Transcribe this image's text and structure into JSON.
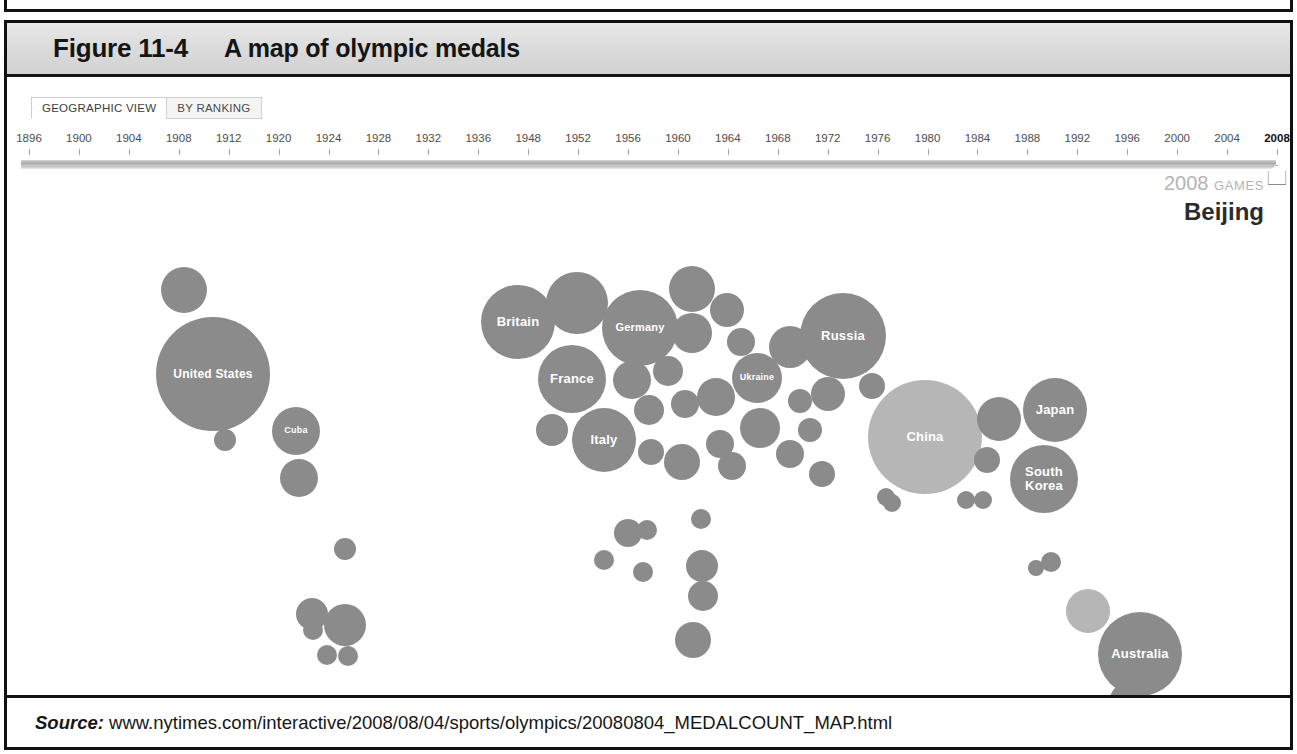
{
  "figure": {
    "number": "Figure 11-4",
    "title": "A map of olympic medals"
  },
  "source": {
    "label": "Source:",
    "url": "www.nytimes.com/interactive/2008/08/04/sports/olympics/20080804_MEDALCOUNT_MAP.html"
  },
  "tabs": [
    {
      "label": "GEOGRAPHIC VIEW",
      "active": true
    },
    {
      "label": "BY RANKING",
      "active": false
    }
  ],
  "timeline": {
    "years": [
      "1896",
      "1900",
      "1904",
      "1908",
      "1912",
      "1920",
      "1924",
      "1928",
      "1932",
      "1936",
      "1948",
      "1952",
      "1956",
      "1960",
      "1964",
      "1968",
      "1972",
      "1976",
      "1980",
      "1984",
      "1988",
      "1992",
      "1996",
      "2000",
      "2004",
      "2008"
    ],
    "selected": "2008",
    "handle_icon": "slider-handle-pentagon"
  },
  "games_caption": {
    "year": "2008",
    "word": "GAMES",
    "city": "Beijing"
  },
  "colors": {
    "bubble_default": "#8b8b8b",
    "bubble_highlight": "#b6b6b6",
    "header_gray": "#dcdcdc",
    "frame_black": "#111111",
    "label_white": "#ffffff"
  },
  "chart_data": {
    "type": "bubble",
    "title": "A map of olympic medals",
    "subtitle": "2008 GAMES Beijing",
    "xlabel": "",
    "ylabel": "",
    "value_encoding": "bubble area = total medals won",
    "legend": "none",
    "grid": false,
    "bubbles": [
      {
        "name": "United States",
        "label": "United States",
        "x": 213,
        "y": 374,
        "r": 57,
        "shade": "default",
        "font": 12
      },
      {
        "name": "Canada",
        "label": "",
        "x": 184,
        "y": 290,
        "r": 23,
        "shade": "default",
        "font": 0
      },
      {
        "name": "Mexico",
        "label": "",
        "x": 225,
        "y": 440,
        "r": 11,
        "shade": "default",
        "font": 0
      },
      {
        "name": "Cuba",
        "label": "Cuba",
        "x": 296,
        "y": 431,
        "r": 24,
        "shade": "default",
        "font": 9
      },
      {
        "name": "Jamaica",
        "label": "",
        "x": 299,
        "y": 478,
        "r": 19,
        "shade": "default",
        "font": 0
      },
      {
        "name": "Colombia",
        "label": "",
        "x": 345,
        "y": 549,
        "r": 11,
        "shade": "default",
        "font": 0
      },
      {
        "name": "Ecuador",
        "label": "",
        "x": 312,
        "y": 614,
        "r": 16,
        "shade": "default",
        "font": 0
      },
      {
        "name": "Peru",
        "label": "",
        "x": 313,
        "y": 630,
        "r": 10,
        "shade": "default",
        "font": 0
      },
      {
        "name": "Brazil",
        "label": "",
        "x": 345,
        "y": 625,
        "r": 21,
        "shade": "default",
        "font": 0
      },
      {
        "name": "Chile",
        "label": "",
        "x": 327,
        "y": 655,
        "r": 10,
        "shade": "default",
        "font": 0
      },
      {
        "name": "Argentina",
        "label": "",
        "x": 348,
        "y": 656,
        "r": 10,
        "shade": "default",
        "font": 0
      },
      {
        "name": "Britain",
        "label": "Britain",
        "x": 518,
        "y": 322,
        "r": 37,
        "shade": "default",
        "font": 13
      },
      {
        "name": "Netherlands",
        "label": "",
        "x": 577,
        "y": 303,
        "r": 31,
        "shade": "default",
        "font": 0
      },
      {
        "name": "Germany",
        "label": "Germany",
        "x": 640,
        "y": 328,
        "r": 38,
        "shade": "default",
        "font": 11
      },
      {
        "name": "Denmark",
        "label": "",
        "x": 692,
        "y": 289,
        "r": 23,
        "shade": "default",
        "font": 0
      },
      {
        "name": "Norway",
        "label": "",
        "x": 692,
        "y": 333,
        "r": 20,
        "shade": "default",
        "font": 0
      },
      {
        "name": "Sweden",
        "label": "",
        "x": 727,
        "y": 310,
        "r": 17,
        "shade": "default",
        "font": 0
      },
      {
        "name": "Poland",
        "label": "",
        "x": 741,
        "y": 342,
        "r": 14,
        "shade": "default",
        "font": 0
      },
      {
        "name": "France",
        "label": "France",
        "x": 572,
        "y": 379,
        "r": 34,
        "shade": "default",
        "font": 13
      },
      {
        "name": "Belgium",
        "label": "",
        "x": 632,
        "y": 380,
        "r": 19,
        "shade": "default",
        "font": 0
      },
      {
        "name": "Czech",
        "label": "",
        "x": 668,
        "y": 371,
        "r": 15,
        "shade": "default",
        "font": 0
      },
      {
        "name": "Austria",
        "label": "",
        "x": 649,
        "y": 410,
        "r": 15,
        "shade": "default",
        "font": 0
      },
      {
        "name": "Hungary",
        "label": "",
        "x": 685,
        "y": 404,
        "r": 14,
        "shade": "default",
        "font": 0
      },
      {
        "name": "Romania",
        "label": "",
        "x": 716,
        "y": 397,
        "r": 19,
        "shade": "default",
        "font": 0
      },
      {
        "name": "Ukraine",
        "label": "Ukraine",
        "x": 757,
        "y": 378,
        "r": 25,
        "shade": "default",
        "font": 9
      },
      {
        "name": "Belarus",
        "label": "",
        "x": 790,
        "y": 347,
        "r": 21,
        "shade": "default",
        "font": 0
      },
      {
        "name": "Italy",
        "label": "Italy",
        "x": 604,
        "y": 440,
        "r": 32,
        "shade": "default",
        "font": 13
      },
      {
        "name": "Spain",
        "label": "",
        "x": 552,
        "y": 430,
        "r": 16,
        "shade": "default",
        "font": 0
      },
      {
        "name": "Slovakia",
        "label": "",
        "x": 651,
        "y": 452,
        "r": 13,
        "shade": "default",
        "font": 0
      },
      {
        "name": "Croatia",
        "label": "",
        "x": 682,
        "y": 462,
        "r": 18,
        "shade": "default",
        "font": 0
      },
      {
        "name": "Slovenia",
        "label": "",
        "x": 720,
        "y": 444,
        "r": 14,
        "shade": "default",
        "font": 0
      },
      {
        "name": "Serbia",
        "label": "",
        "x": 732,
        "y": 466,
        "r": 14,
        "shade": "default",
        "font": 0
      },
      {
        "name": "Bulgaria",
        "label": "",
        "x": 760,
        "y": 428,
        "r": 20,
        "shade": "default",
        "font": 0
      },
      {
        "name": "Greece",
        "label": "",
        "x": 790,
        "y": 454,
        "r": 14,
        "shade": "default",
        "font": 0
      },
      {
        "name": "Turkey",
        "label": "",
        "x": 810,
        "y": 430,
        "r": 12,
        "shade": "default",
        "font": 0
      },
      {
        "name": "Georgia",
        "label": "",
        "x": 828,
        "y": 394,
        "r": 17,
        "shade": "default",
        "font": 0
      },
      {
        "name": "Azerbaijan",
        "label": "",
        "x": 800,
        "y": 401,
        "r": 12,
        "shade": "default",
        "font": 0
      },
      {
        "name": "Russia",
        "label": "Russia",
        "x": 843,
        "y": 336,
        "r": 43,
        "shade": "default",
        "font": 13
      },
      {
        "name": "Kazakhstan",
        "label": "",
        "x": 872,
        "y": 386,
        "r": 13,
        "shade": "default",
        "font": 0
      },
      {
        "name": "Uzbekistan",
        "label": "",
        "x": 822,
        "y": 474,
        "r": 13,
        "shade": "default",
        "font": 0
      },
      {
        "name": "China",
        "label": "China",
        "x": 925,
        "y": 437,
        "r": 57,
        "shade": "highlight",
        "font": 13
      },
      {
        "name": "Mongolia",
        "label": "",
        "x": 886,
        "y": 497,
        "r": 9,
        "shade": "default",
        "font": 0
      },
      {
        "name": "India",
        "label": "",
        "x": 892,
        "y": 503,
        "r": 9,
        "shade": "default",
        "font": 0
      },
      {
        "name": "Thailand",
        "label": "",
        "x": 966,
        "y": 500,
        "r": 9,
        "shade": "default",
        "font": 0
      },
      {
        "name": "Indonesia",
        "label": "",
        "x": 983,
        "y": 500,
        "r": 9,
        "shade": "default",
        "font": 0
      },
      {
        "name": "Taiwan",
        "label": "",
        "x": 999,
        "y": 419,
        "r": 22,
        "shade": "default",
        "font": 0
      },
      {
        "name": "Hong Kong",
        "label": "",
        "x": 987,
        "y": 460,
        "r": 13,
        "shade": "default",
        "font": 0
      },
      {
        "name": "Japan",
        "label": "Japan",
        "x": 1055,
        "y": 410,
        "r": 32,
        "shade": "default",
        "font": 13
      },
      {
        "name": "South Korea",
        "label": "South Korea",
        "x": 1044,
        "y": 479,
        "r": 34,
        "shade": "default",
        "font": 13
      },
      {
        "name": "Ethiopia",
        "label": "",
        "x": 628,
        "y": 533,
        "r": 14,
        "shade": "default",
        "font": 0
      },
      {
        "name": "Kenya",
        "label": "",
        "x": 647,
        "y": 530,
        "r": 10,
        "shade": "default",
        "font": 0
      },
      {
        "name": "Nigeria",
        "label": "",
        "x": 604,
        "y": 560,
        "r": 10,
        "shade": "default",
        "font": 0
      },
      {
        "name": "Cameroon",
        "label": "",
        "x": 643,
        "y": 572,
        "r": 10,
        "shade": "default",
        "font": 0
      },
      {
        "name": "Morocco",
        "label": "",
        "x": 701,
        "y": 519,
        "r": 10,
        "shade": "default",
        "font": 0
      },
      {
        "name": "Egypt",
        "label": "",
        "x": 702,
        "y": 566,
        "r": 16,
        "shade": "default",
        "font": 0
      },
      {
        "name": "Tunisia",
        "label": "",
        "x": 703,
        "y": 596,
        "r": 15,
        "shade": "default",
        "font": 0
      },
      {
        "name": "South Africa",
        "label": "",
        "x": 693,
        "y": 640,
        "r": 18,
        "shade": "default",
        "font": 0
      },
      {
        "name": "Papua",
        "label": "",
        "x": 1036,
        "y": 568,
        "r": 8,
        "shade": "default",
        "font": 0
      },
      {
        "name": "Fiji",
        "label": "",
        "x": 1051,
        "y": 562,
        "r": 10,
        "shade": "default",
        "font": 0
      },
      {
        "name": "New Zealand",
        "label": "",
        "x": 1088,
        "y": 611,
        "r": 22,
        "shade": "highlight",
        "font": 0
      },
      {
        "name": "Australia",
        "label": "Australia",
        "x": 1140,
        "y": 654,
        "r": 42,
        "shade": "default",
        "font": 13
      },
      {
        "name": "Tasmania",
        "label": "",
        "x": 1127,
        "y": 700,
        "r": 17,
        "shade": "default",
        "font": 0
      }
    ]
  }
}
